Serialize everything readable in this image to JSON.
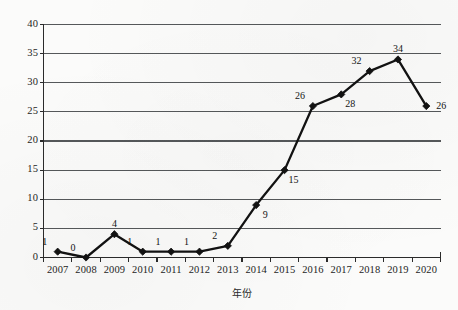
{
  "chart_data": {
    "type": "line",
    "title": "",
    "subtitle": "",
    "xlabel": "年份",
    "ylabel": "",
    "categories": [
      "2007",
      "2008",
      "2009",
      "2010",
      "2011",
      "2012",
      "2013",
      "2014",
      "2015",
      "2016",
      "2017",
      "2018",
      "2019",
      "2020"
    ],
    "values": [
      1,
      0,
      4,
      1,
      1,
      1,
      2,
      9,
      15,
      26,
      28,
      32,
      34,
      26
    ],
    "point_labels": [
      "1",
      "0",
      "4",
      "1",
      "1",
      "1",
      "2",
      "9",
      "15",
      "26",
      "28",
      "32",
      "34",
      "26"
    ],
    "series": [
      {
        "name": "",
        "values": [
          1,
          0,
          4,
          1,
          1,
          1,
          2,
          9,
          15,
          26,
          28,
          32,
          34,
          26
        ]
      }
    ],
    "ylim": [
      0,
      40
    ],
    "y_ticks": [
      0,
      5,
      10,
      15,
      20,
      25,
      30,
      35,
      40
    ],
    "y_tick_labels": [
      "0",
      "5",
      "10",
      "15",
      "20",
      "25",
      "30",
      "35",
      "40"
    ],
    "grid": "horizontal",
    "legend": "none",
    "marker": "diamond",
    "line_color": "#121212",
    "marker_color": "#121212",
    "grid_color": "#55585a",
    "axis_color": "#2b2b2b",
    "background_color": "#fbfbfa",
    "label_placement": [
      "above-left",
      "above-left",
      "above-center",
      "above-left",
      "above-left",
      "above-left",
      "above-left",
      "below-right",
      "below-right",
      "above-left",
      "below-right",
      "above-left",
      "above-center",
      "right"
    ]
  }
}
